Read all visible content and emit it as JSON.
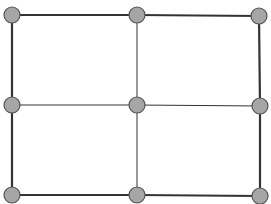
{
  "diagram": {
    "type": "grid-graph",
    "rows": 3,
    "cols": 3,
    "node_fill": "#a6a6a6",
    "node_stroke": "#555555",
    "edge_color": "#333333",
    "nodes": [
      {
        "id": "n00",
        "x": 12,
        "y": 15
      },
      {
        "id": "n01",
        "x": 137,
        "y": 15
      },
      {
        "id": "n02",
        "x": 259,
        "y": 16
      },
      {
        "id": "n10",
        "x": 12,
        "y": 105
      },
      {
        "id": "n11",
        "x": 137,
        "y": 105
      },
      {
        "id": "n12",
        "x": 260,
        "y": 106
      },
      {
        "id": "n20",
        "x": 12,
        "y": 195
      },
      {
        "id": "n21",
        "x": 137,
        "y": 195
      },
      {
        "id": "n22",
        "x": 260,
        "y": 196
      }
    ],
    "edges": [
      {
        "from": "n00",
        "to": "n01",
        "weight": 2
      },
      {
        "from": "n01",
        "to": "n02",
        "weight": 2
      },
      {
        "from": "n10",
        "to": "n11",
        "weight": 1
      },
      {
        "from": "n11",
        "to": "n12",
        "weight": 1
      },
      {
        "from": "n20",
        "to": "n21",
        "weight": 2
      },
      {
        "from": "n21",
        "to": "n22",
        "weight": 2
      },
      {
        "from": "n00",
        "to": "n10",
        "weight": 2
      },
      {
        "from": "n10",
        "to": "n20",
        "weight": 2
      },
      {
        "from": "n01",
        "to": "n11",
        "weight": 1
      },
      {
        "from": "n11",
        "to": "n21",
        "weight": 1
      },
      {
        "from": "n02",
        "to": "n12",
        "weight": 2
      },
      {
        "from": "n12",
        "to": "n22",
        "weight": 2
      }
    ]
  }
}
